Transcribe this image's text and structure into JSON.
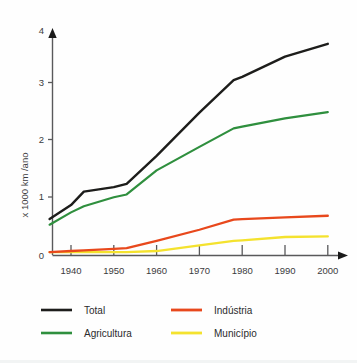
{
  "chart_data": {
    "type": "line",
    "title": "",
    "subtitle": "",
    "xlabel": "",
    "ylabel": "x 1000 km /ano",
    "xlim": [
      1935,
      2000
    ],
    "ylim": [
      0,
      4
    ],
    "grid": false,
    "legend_position": "bottom",
    "x_ticks": [
      "1940",
      "1950",
      "1960",
      "1970",
      "1980",
      "1990",
      "2000"
    ],
    "x_tick_values": [
      1940,
      1950,
      1960,
      1970,
      1980,
      1990,
      2000
    ],
    "y_ticks": [
      "0",
      "1",
      "2",
      "3",
      "4"
    ],
    "y_tick_values": [
      0,
      1,
      2,
      3,
      4
    ],
    "x": [
      1935,
      1940,
      1943,
      1950,
      1953,
      1960,
      1970,
      1978,
      1980,
      1990,
      2000
    ],
    "series": [
      {
        "name": "Total",
        "color": "#1d1d1b",
        "values": [
          0.65,
          0.9,
          1.14,
          1.22,
          1.28,
          1.78,
          2.55,
          3.13,
          3.19,
          3.55,
          3.78
        ]
      },
      {
        "name": "Agricultura",
        "color": "#2f8f3e",
        "values": [
          0.55,
          0.77,
          0.88,
          1.04,
          1.09,
          1.52,
          1.94,
          2.27,
          2.3,
          2.45,
          2.56
        ]
      },
      {
        "name": "Indústria",
        "color": "#e8481c",
        "values": [
          0.06,
          0.08,
          0.09,
          0.12,
          0.13,
          0.26,
          0.46,
          0.64,
          0.65,
          0.68,
          0.71
        ]
      },
      {
        "name": "Município",
        "color": "#f4e22e",
        "values": [
          0.06,
          0.06,
          0.06,
          0.06,
          0.06,
          0.08,
          0.18,
          0.26,
          0.27,
          0.33,
          0.34
        ]
      }
    ]
  },
  "axis": {
    "y_label": "x 1000 km /ano",
    "y_tick_0": "0",
    "y_tick_1": "1",
    "y_tick_2": "2",
    "y_tick_3": "3",
    "y_tick_4": "4",
    "x_tick_1940": "1940",
    "x_tick_1950": "1950",
    "x_tick_1960": "1960",
    "x_tick_1970": "1970",
    "x_tick_1980": "1980",
    "x_tick_1990": "1990",
    "x_tick_2000": "2000"
  },
  "legend": {
    "items": [
      {
        "label": "Total",
        "color": "#1d1d1b"
      },
      {
        "label": "Indústria",
        "color": "#e8481c"
      },
      {
        "label": "Agricultura",
        "color": "#2f8f3e"
      },
      {
        "label": "Município",
        "color": "#f4e22e"
      }
    ]
  }
}
